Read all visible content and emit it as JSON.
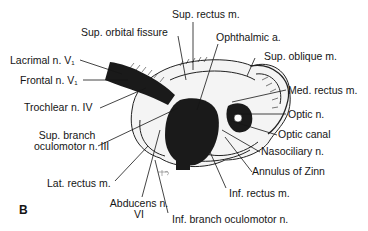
{
  "figure": {
    "panel_label": "B",
    "labels": {
      "sup_rectus": "Sup. rectus m.",
      "sup_orbital_fissure": "Sup. orbital fissure",
      "ophthalmic_a": "Ophthalmic a.",
      "sup_oblique": "Sup. oblique m.",
      "lacrimal": "Lacrimal n. V",
      "lacrimal_sub": "1",
      "frontal": "Frontal n. V",
      "frontal_sub": "1",
      "med_rectus": "Med. rectus m.",
      "trochlear": "Trochlear n. IV",
      "optic_n": "Optic n.",
      "optic_canal": "Optic canal",
      "sup_branch_1": "Sup. branch",
      "sup_branch_2": "oculomotor n. III",
      "nasociliary": "Nasociliary n.",
      "annulus": "Annulus of Zinn",
      "lat_rectus": "Lat. rectus m.",
      "inf_rectus": "Inf. rectus m.",
      "abducens_1": "Abducens n.",
      "abducens_2": "VI",
      "inf_branch": "Inf. branch oculomotor n."
    },
    "colors": {
      "ink": "#151515",
      "background": "#ffffff",
      "fill_dark": "#1a1a1a",
      "fill_light": "#f2f2f2"
    }
  }
}
